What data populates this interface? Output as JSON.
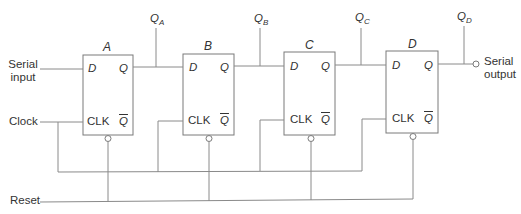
{
  "diagram": {
    "inputs": {
      "serial_input": "Serial input",
      "serial_input_line1": "Serial",
      "serial_input_line2": "input",
      "clock": "Clock",
      "reset": "Reset"
    },
    "output": {
      "serial_output_line1": "Serial",
      "serial_output_line2": "output"
    },
    "flip_flops": [
      {
        "name": "A",
        "pin_d": "D",
        "pin_q": "Q",
        "pin_clk": "CLK",
        "pin_qbar": "Q",
        "output_label": "Q",
        "output_sub": "A"
      },
      {
        "name": "B",
        "pin_d": "D",
        "pin_q": "Q",
        "pin_clk": "CLK",
        "pin_qbar": "Q",
        "output_label": "Q",
        "output_sub": "B"
      },
      {
        "name": "C",
        "pin_d": "D",
        "pin_q": "Q",
        "pin_clk": "CLK",
        "pin_qbar": "Q",
        "output_label": "Q",
        "output_sub": "C"
      },
      {
        "name": "D",
        "pin_d": "D",
        "pin_q": "Q",
        "pin_clk": "CLK",
        "pin_qbar": "Q",
        "output_label": "Q",
        "output_sub": "D"
      }
    ],
    "colors": {
      "wire": "#8a8a8a",
      "text": "#333333",
      "background": "#ffffff"
    }
  }
}
